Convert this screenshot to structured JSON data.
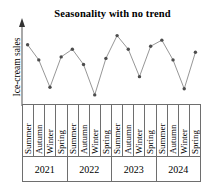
{
  "chart_data": {
    "type": "line",
    "title": "Seasonality with no trend",
    "xlabel": "",
    "ylabel": "Ice-cream sales",
    "grid": false,
    "legend": null,
    "axis_style": {
      "y_axis_arrow": true,
      "x_axis_table": true,
      "line_color": "#6e6e6e",
      "marker_color": "#4d4d4d",
      "marker_shape": "circle"
    },
    "ylim": [
      0,
      100
    ],
    "categories": [
      "Summer",
      "Autumn",
      "Winter",
      "Spring",
      "Summer",
      "Autumn",
      "Winter",
      "Spring",
      "Summer",
      "Autumn",
      "Winter",
      "Spring",
      "Summer",
      "Autumn",
      "Winter",
      "Spring"
    ],
    "years": [
      "2021",
      "2022",
      "2023",
      "2024"
    ],
    "seasons_per_year": [
      "Summer",
      "Autumn",
      "Winter",
      "Spring"
    ],
    "values": [
      78,
      58,
      22,
      62,
      72,
      52,
      12,
      60,
      90,
      72,
      36,
      76,
      84,
      58,
      20,
      68
    ],
    "points": [
      {
        "year": "2021",
        "season": "Summer",
        "value": 78
      },
      {
        "year": "2021",
        "season": "Autumn",
        "value": 58
      },
      {
        "year": "2021",
        "season": "Winter",
        "value": 22
      },
      {
        "year": "2021",
        "season": "Spring",
        "value": 62
      },
      {
        "year": "2022",
        "season": "Summer",
        "value": 72
      },
      {
        "year": "2022",
        "season": "Autumn",
        "value": 52
      },
      {
        "year": "2022",
        "season": "Winter",
        "value": 12
      },
      {
        "year": "2022",
        "season": "Spring",
        "value": 60
      },
      {
        "year": "2023",
        "season": "Summer",
        "value": 90
      },
      {
        "year": "2023",
        "season": "Autumn",
        "value": 72
      },
      {
        "year": "2023",
        "season": "Winter",
        "value": 36
      },
      {
        "year": "2023",
        "season": "Spring",
        "value": 76
      },
      {
        "year": "2024",
        "season": "Summer",
        "value": 84
      },
      {
        "year": "2024",
        "season": "Autumn",
        "value": 58
      },
      {
        "year": "2024",
        "season": "Winter",
        "value": 20
      },
      {
        "year": "2024",
        "season": "Spring",
        "value": 68
      }
    ]
  }
}
